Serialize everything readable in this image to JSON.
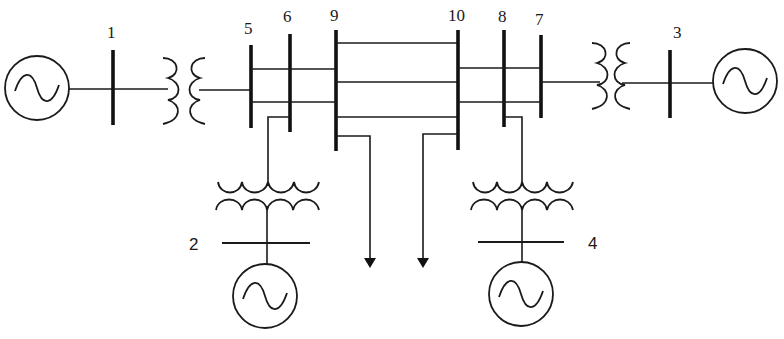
{
  "diagram": {
    "title": "",
    "buses": [
      {
        "id": "bus-1",
        "label": "1"
      },
      {
        "id": "bus-2",
        "label": "2"
      },
      {
        "id": "bus-3",
        "label": "3"
      },
      {
        "id": "bus-4",
        "label": "4"
      },
      {
        "id": "bus-5",
        "label": "5"
      },
      {
        "id": "bus-6",
        "label": "6"
      },
      {
        "id": "bus-7",
        "label": "7"
      },
      {
        "id": "bus-8",
        "label": "8"
      },
      {
        "id": "bus-9",
        "label": "9"
      },
      {
        "id": "bus-10",
        "label": "10"
      }
    ],
    "generators": [
      {
        "id": "gen-1",
        "bus": "1",
        "icon": "ac-source-icon"
      },
      {
        "id": "gen-2",
        "bus": "2",
        "icon": "ac-source-icon"
      },
      {
        "id": "gen-3",
        "bus": "3",
        "icon": "ac-source-icon"
      },
      {
        "id": "gen-4",
        "bus": "4",
        "icon": "ac-source-icon"
      }
    ],
    "transformers": [
      {
        "from": "1",
        "to": "5"
      },
      {
        "from": "2",
        "to": "6"
      },
      {
        "from": "3",
        "to": "7"
      },
      {
        "from": "4",
        "to": "8"
      }
    ],
    "lines": [
      {
        "from": "5",
        "to": "6"
      },
      {
        "from": "6",
        "to": "9",
        "count": 2
      },
      {
        "from": "9",
        "to": "10",
        "count": 3
      },
      {
        "from": "10",
        "to": "8",
        "count": 2
      },
      {
        "from": "8",
        "to": "7"
      }
    ],
    "loads": [
      {
        "bus": "9",
        "icon": "load-arrow-icon"
      },
      {
        "bus": "10",
        "icon": "load-arrow-icon"
      }
    ]
  }
}
